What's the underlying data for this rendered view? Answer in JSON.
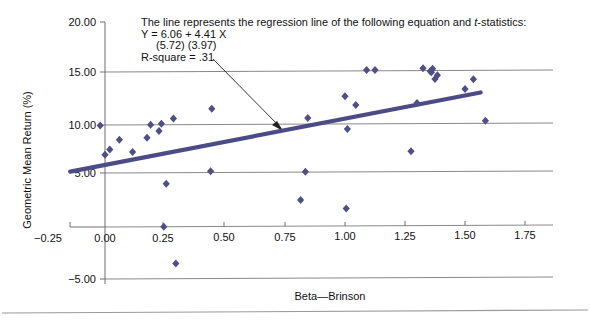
{
  "chart_data": {
    "type": "scatter",
    "title": "",
    "xlabel": "Beta—Brinson",
    "ylabel": "Geometric Mean Return (%)",
    "xlim": [
      -0.25,
      1.75
    ],
    "ylim": [
      -5.0,
      20.0
    ],
    "xticks": [
      -0.25,
      0.0,
      0.25,
      0.5,
      0.75,
      1.0,
      1.25,
      1.5,
      1.75
    ],
    "xtick_labels": [
      "−0.25",
      "0.00",
      "0.25",
      "0.50",
      "0.75",
      "1.00",
      "1.25",
      "1.50",
      "1.75"
    ],
    "yticks": [
      -5.0,
      0.0,
      5.0,
      10.0,
      15.0,
      20.0
    ],
    "ytick_labels": [
      "−5.00",
      "0.00",
      "5.00",
      "10.00",
      "15.00",
      "20.00"
    ],
    "grid": true,
    "grid_axis": "y",
    "legend": "none",
    "marker": "diamond",
    "marker_color": "#4f4f86",
    "points": [
      {
        "x": -0.02,
        "y": 9.9
      },
      {
        "x": 0.0,
        "y": 7.05
      },
      {
        "x": 0.02,
        "y": 7.55
      },
      {
        "x": 0.06,
        "y": 8.5
      },
      {
        "x": 0.115,
        "y": 7.3
      },
      {
        "x": 0.175,
        "y": 8.7
      },
      {
        "x": 0.19,
        "y": 9.95
      },
      {
        "x": 0.225,
        "y": 9.35
      },
      {
        "x": 0.235,
        "y": 10.05
      },
      {
        "x": 0.245,
        "y": 0.0
      },
      {
        "x": 0.255,
        "y": 4.2
      },
      {
        "x": 0.285,
        "y": 10.55
      },
      {
        "x": 0.295,
        "y": -3.6
      },
      {
        "x": 0.44,
        "y": 5.4
      },
      {
        "x": 0.445,
        "y": 11.5
      },
      {
        "x": 0.815,
        "y": 2.55
      },
      {
        "x": 0.835,
        "y": 5.3
      },
      {
        "x": 0.845,
        "y": 10.55
      },
      {
        "x": 1.0,
        "y": 12.65
      },
      {
        "x": 1.005,
        "y": 1.7
      },
      {
        "x": 1.01,
        "y": 9.45
      },
      {
        "x": 1.045,
        "y": 11.8
      },
      {
        "x": 1.09,
        "y": 15.2
      },
      {
        "x": 1.125,
        "y": 15.2
      },
      {
        "x": 1.275,
        "y": 7.25
      },
      {
        "x": 1.3,
        "y": 11.95
      },
      {
        "x": 1.325,
        "y": 15.35
      },
      {
        "x": 1.355,
        "y": 15.05
      },
      {
        "x": 1.36,
        "y": 14.95
      },
      {
        "x": 1.365,
        "y": 15.3
      },
      {
        "x": 1.375,
        "y": 14.3
      },
      {
        "x": 1.385,
        "y": 14.65
      },
      {
        "x": 1.5,
        "y": 13.3
      },
      {
        "x": 1.535,
        "y": 14.25
      },
      {
        "x": 1.585,
        "y": 10.2
      }
    ],
    "regression": {
      "intercept": 6.06,
      "slope": 4.41,
      "r_square": 0.31,
      "t_intercept": 5.72,
      "t_slope": 3.97,
      "x_start": -0.145,
      "x_end": 1.565,
      "color": "#4b4b86"
    }
  },
  "annotation": {
    "line1_a": "The line represents the regression line of the following equation and ",
    "line1_ital": "t",
    "line1_b": "-statistics:",
    "line2": "Y =  6.06  + 4.41 X",
    "line3": "(5.72)   (3.97)",
    "line4": "R-square = .31"
  }
}
